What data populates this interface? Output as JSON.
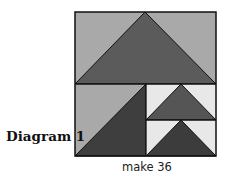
{
  "diagram": {
    "label": "Diagram 1",
    "caption": "make 36",
    "colors": {
      "background_light": "#a9a9a9",
      "goose_large": "#5b5b5b",
      "goose_left_dark": "#3e3e3e",
      "sky_white": "#e8e8e8",
      "goose_small_top": "#555555",
      "goose_small_bottom": "#3c3c3c",
      "outline": "#111111"
    },
    "block": {
      "x": 75,
      "y": 12,
      "width": 141,
      "height": 144,
      "horizontal_divider_y": 84,
      "vertical_divider_x": 146,
      "small_divider_y": 120
    },
    "units": [
      {
        "name": "large-flying-goose",
        "type": "flying-geese",
        "apex": [
          145,
          12
        ],
        "base": [
          [
            75,
            84
          ],
          [
            216,
            84
          ]
        ]
      },
      {
        "name": "half-square-triangle",
        "type": "hst",
        "region": [
          [
            75,
            84
          ],
          [
            146,
            156
          ]
        ]
      },
      {
        "name": "small-flying-goose-top",
        "type": "flying-geese",
        "apex": [
          181,
          84
        ],
        "base": [
          [
            146,
            120
          ],
          [
            216,
            120
          ]
        ]
      },
      {
        "name": "small-flying-goose-bottom",
        "type": "flying-geese",
        "apex": [
          181,
          120
        ],
        "base": [
          [
            146,
            156
          ],
          [
            216,
            156
          ]
        ]
      }
    ]
  }
}
